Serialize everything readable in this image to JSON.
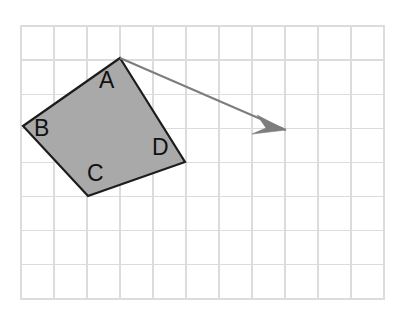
{
  "figure": {
    "canvas": {
      "width": 408,
      "height": 327,
      "background": "#ffffff"
    }
  },
  "grid": {
    "name": "square-grid",
    "origin_x": 21,
    "origin_y": 26,
    "columns": 11,
    "rows": 8,
    "cell_width": 33,
    "cell_height": 34.1,
    "line_color": "#dcdcdc",
    "border_color": "#dcdcdc",
    "visible": true
  },
  "shape": {
    "name": "quadrilateral",
    "type": "polygon",
    "fill_color": "#a9a9a9",
    "stroke_color": "#1c1c1c",
    "stroke_width": 2.2,
    "points": "120,58 23,126 88,196 185,162",
    "vertices": [
      {
        "label": "A",
        "role": "top-apex",
        "x": 120,
        "y": 58
      },
      {
        "label": "B",
        "role": "left",
        "x": 23,
        "y": 126
      },
      {
        "label": "C",
        "role": "bottom",
        "x": 88,
        "y": 196
      },
      {
        "label": "D",
        "role": "right",
        "x": 185,
        "y": 162
      }
    ]
  },
  "labels": [
    {
      "text": "A",
      "x": 99,
      "y": 69,
      "color": "#111111"
    },
    {
      "text": "B",
      "x": 34,
      "y": 117,
      "color": "#111111"
    },
    {
      "text": "C",
      "x": 87,
      "y": 162,
      "color": "#111111"
    },
    {
      "text": "D",
      "x": 152,
      "y": 136,
      "color": "#111111"
    }
  ],
  "arrow": {
    "name": "direction-arrow",
    "color": "#7d7d7d",
    "stroke_width": 2.0,
    "start_x": 120,
    "start_y": 58,
    "end_x": 286,
    "end_y": 130,
    "head_points": "286,130 257,115 266,128 252,134"
  }
}
